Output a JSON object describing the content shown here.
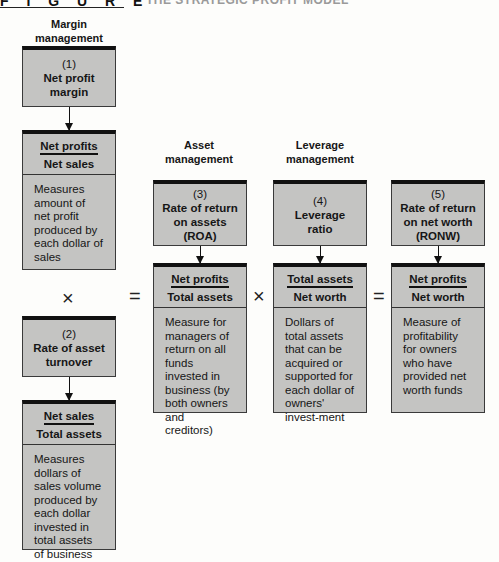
{
  "header": {
    "figure_label": "F I G U R E",
    "title": "THE STRATEGIC PROFIT MODEL"
  },
  "columns": {
    "margin": "Margin management",
    "asset": "Asset management",
    "leverage": "Leverage management"
  },
  "boxes": {
    "net_profit_margin": {
      "number": "(1)",
      "title_line1": "Net profit",
      "title_line2": "margin",
      "numerator": "Net profits",
      "denominator": "Net sales",
      "description": "Measures amount of net profit produced by each dollar of sales"
    },
    "asset_turnover": {
      "number": "(2)",
      "title_line1": "Rate of asset",
      "title_line2": "turnover",
      "numerator": "Net sales",
      "denominator": "Total assets",
      "description": "Measures dollars of sales volume produced by each dollar invested in total assets of business"
    },
    "roa": {
      "number": "(3)",
      "title_line1": "Rate of return",
      "title_line2": "on assets",
      "title_line3": "(ROA)",
      "numerator": "Net profits",
      "denominator": "Total assets",
      "description": "Measure for managers of return on all funds invested in business (by both owners and creditors)"
    },
    "leverage_ratio": {
      "number": "(4)",
      "title_line1": "Leverage",
      "title_line2": "ratio",
      "numerator": "Total assets",
      "denominator": "Net worth",
      "description": "Dollars of total assets that can be acquired or supported for each dollar of owners' invest-ment"
    },
    "ronw": {
      "number": "(5)",
      "title_line1": "Rate of return",
      "title_line2": "on net worth",
      "title_line3": "(RONW)",
      "numerator": "Net profits",
      "denominator": "Net worth",
      "description": "Measure of profitability for owners who have provided net worth funds"
    }
  },
  "operators": {
    "times": "×",
    "equals": "="
  },
  "colors": {
    "box_fill": "#c4c4c2",
    "box_top_border": "#111111",
    "background": "#fdfdfb"
  }
}
